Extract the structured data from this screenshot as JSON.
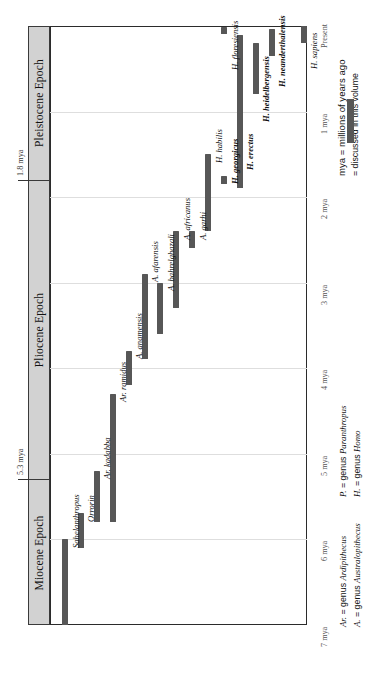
{
  "figure": {
    "orientation": "rotated-90-ccw",
    "bar_color": "#575757",
    "epoch_band_color": "#d2d2d2"
  },
  "axis": {
    "ticks": [
      {
        "label": "Present",
        "mya": 0
      },
      {
        "label": "1 mya",
        "mya": 1
      },
      {
        "label": "2 mya",
        "mya": 2
      },
      {
        "label": "3 mya",
        "mya": 3
      },
      {
        "label": "4 mya",
        "mya": 4
      },
      {
        "label": "5 mya",
        "mya": 5
      },
      {
        "label": "6 mya",
        "mya": 6
      },
      {
        "label": "7 mya",
        "mya": 7
      }
    ],
    "boundaries": [
      {
        "label": "1.8 mya",
        "mya": 1.8
      },
      {
        "label": "5.3 mya",
        "mya": 5.3
      }
    ]
  },
  "epochs": [
    {
      "name": "Pleistocene Epoch",
      "start_mya": 1.8,
      "end_mya": 0.0
    },
    {
      "name": "Pliocene Epoch",
      "start_mya": 5.3,
      "end_mya": 1.8
    },
    {
      "name": "Miocene Epoch",
      "start_mya": 7.0,
      "end_mya": 5.3
    }
  ],
  "legend": {
    "mya_note": "mya = millions of years ago",
    "swatch_note": "= discussed in this volume",
    "genus_key": [
      {
        "abbr": "Ar.",
        "text": " = genus ",
        "genus": "Ardipithecus"
      },
      {
        "abbr": "A.",
        "text": " = genus ",
        "genus": "Australopithecus"
      },
      {
        "abbr": "P.",
        "text": " = genus ",
        "genus": "Paranthropus"
      },
      {
        "abbr": "H.",
        "text": " = genus ",
        "genus": "Homo"
      }
    ]
  },
  "chart_data": {
    "type": "bar",
    "title": "",
    "xlabel": "",
    "ylabel": "millions of years ago (mya)",
    "ylim": [
      7.0,
      0.0
    ],
    "grid": true,
    "orientation": "horizontal-ranges",
    "categories": [
      "Sahelanthropus",
      "Orrorin",
      "Ar. kadabba",
      "Ar. ramidus",
      "A. anamensis",
      "A. afarensis",
      "A. bahrelghazali",
      "A. africanus",
      "A. garhi",
      "H. habilis",
      "H. georgicus",
      "H. erectus",
      "H. heidelbergensis",
      "H. neanderthalensis",
      "H. floresiensis",
      "H. sapiens"
    ],
    "ranges_mya": [
      [
        7.0,
        6.0
      ],
      [
        6.1,
        5.7
      ],
      [
        5.8,
        5.2
      ],
      [
        5.8,
        4.3
      ],
      [
        4.2,
        3.8
      ],
      [
        3.9,
        2.9
      ],
      [
        3.6,
        3.0
      ],
      [
        3.3,
        2.4
      ],
      [
        2.6,
        2.4
      ],
      [
        2.4,
        1.5
      ],
      [
        1.85,
        1.75
      ],
      [
        1.9,
        0.1
      ],
      [
        0.8,
        0.2
      ],
      [
        0.35,
        0.03
      ],
      [
        0.09,
        0.01
      ],
      [
        0.2,
        0.0
      ]
    ]
  },
  "species": [
    {
      "name": "Sahelanthropus",
      "col": 0,
      "from": 7.0,
      "to": 6.0,
      "label_mya": 6.05
    },
    {
      "name": "Orrorin",
      "col": 1,
      "from": 6.1,
      "to": 5.7,
      "label_mya": 5.74
    },
    {
      "name": "Ar. kadabba",
      "col": 2,
      "from": 5.8,
      "to": 5.2,
      "label_mya": 5.24
    },
    {
      "name": "Ar. ramidus",
      "col": 3,
      "from": 5.8,
      "to": 4.3,
      "label_mya": 4.34
    },
    {
      "name": "A. anamensis",
      "col": 4,
      "from": 4.2,
      "to": 3.8,
      "label_mya": 3.84
    },
    {
      "name": "A. afarensis",
      "col": 5,
      "from": 3.9,
      "to": 2.9,
      "label_mya": 2.94
    },
    {
      "name": "A. bahrelghazali",
      "col": 6,
      "from": 3.6,
      "to": 3.0,
      "label_mya": 3.04
    },
    {
      "name": "A. africanus",
      "col": 7,
      "from": 3.3,
      "to": 2.4,
      "label_mya": 2.44
    },
    {
      "name": "A. garhi",
      "col": 8,
      "from": 2.6,
      "to": 2.4,
      "label_mya": 2.44
    },
    {
      "name": "H. habilis",
      "col": 9,
      "from": 2.4,
      "to": 1.5,
      "label_mya": 1.54
    },
    {
      "name": "H. georgicus",
      "col": 10,
      "from": 1.85,
      "to": 1.75,
      "label_mya": 1.79
    },
    {
      "name": "H. erectus",
      "col": 11,
      "from": 1.9,
      "to": 0.1,
      "label_mya": 1.62
    },
    {
      "name": "H. heidelbergensis",
      "col": 12,
      "from": 0.8,
      "to": 0.2,
      "label_mya": 1.06
    },
    {
      "name": "H. neanderthalensis",
      "col": 13,
      "from": 0.35,
      "to": 0.03,
      "label_mya": 0.66
    },
    {
      "name": "H. floresiensis",
      "col": 10,
      "from": 0.09,
      "to": 0.01,
      "label_mya": 0.46
    },
    {
      "name": "H. sapiens",
      "col": 15,
      "from": 0.2,
      "to": 0.0,
      "label_mya": 0.44
    }
  ]
}
